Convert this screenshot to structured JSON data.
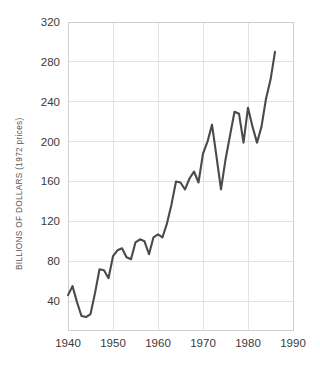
{
  "chart_data": {
    "type": "line",
    "title": "",
    "xlabel": "",
    "ylabel": "BILLIONS OF DOLLARS (1972 prices)",
    "xlim": [
      1940,
      1990
    ],
    "ylim": [
      11,
      320
    ],
    "xticks": [
      1940,
      1950,
      1960,
      1970,
      1980,
      1990
    ],
    "yticks": [
      40,
      80,
      120,
      160,
      200,
      240,
      280,
      320
    ],
    "grid": true,
    "legend": "none",
    "line_color": "#4a4a4a",
    "grid_color": "#e2e2e2",
    "background_color": "#ffffff",
    "series": [
      {
        "name": "Capital spending",
        "x": [
          1940,
          1941,
          1942,
          1943,
          1944,
          1945,
          1946,
          1947,
          1948,
          1949,
          1950,
          1951,
          1952,
          1953,
          1954,
          1955,
          1956,
          1957,
          1958,
          1959,
          1960,
          1961,
          1962,
          1963,
          1964,
          1965,
          1966,
          1967,
          1968,
          1969,
          1970,
          1971,
          1972,
          1973,
          1974,
          1975,
          1976,
          1977,
          1978,
          1979,
          1980,
          1981,
          1982,
          1983,
          1984,
          1985,
          1986
        ],
        "values": [
          46,
          55,
          39,
          25,
          24,
          27,
          48,
          72,
          71,
          63,
          85,
          91,
          93,
          84,
          82,
          99,
          102,
          100,
          87,
          104,
          107,
          104,
          118,
          137,
          160,
          159,
          152,
          163,
          170,
          159,
          188,
          200,
          217,
          185,
          152,
          182,
          206,
          230,
          228,
          199,
          234,
          215,
          199,
          215,
          243,
          262,
          290
        ]
      }
    ]
  },
  "axis": {
    "y_tick_labels": [
      "320",
      "280",
      "240",
      "200",
      "160",
      "120",
      "80",
      "40"
    ],
    "x_tick_labels": [
      "1940",
      "1950",
      "1960",
      "1970",
      "1980",
      "1990"
    ],
    "y_axis_title": "BILLIONS OF DOLLARS (1972 prices)"
  }
}
